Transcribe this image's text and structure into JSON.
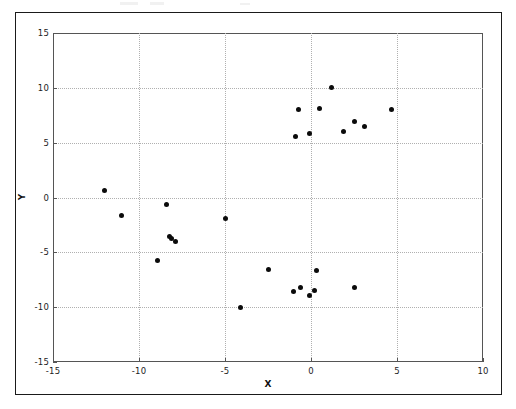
{
  "figure": {
    "background_color": "#ffffff",
    "frame_color": "#1a1a1a",
    "axes_color": "#555555",
    "grid_color": "#b0b0b0",
    "marker_color": "#0b0b0b"
  },
  "chart_data": {
    "type": "scatter",
    "title": "",
    "xlabel": "X",
    "ylabel": "Y",
    "xlim": [
      -15,
      10
    ],
    "ylim": [
      -15,
      15
    ],
    "xticks": [
      -15,
      -10,
      -5,
      0,
      5,
      10
    ],
    "yticks": [
      -15,
      -10,
      -5,
      0,
      5,
      10,
      15
    ],
    "xticklabels": [
      "-15",
      "-10",
      "-5",
      "0",
      "5",
      "10"
    ],
    "yticklabels": [
      "-15",
      "-10",
      "-5",
      "0",
      "5",
      "10",
      "15"
    ],
    "grid": true,
    "grid_style": "dotted",
    "legend": false,
    "marker": "circle",
    "marker_size": 5,
    "series": [
      {
        "name": "points",
        "color": "#0b0b0b",
        "points": [
          [
            -12.0,
            0.6
          ],
          [
            -11.0,
            -1.6
          ],
          [
            -8.4,
            -0.6
          ],
          [
            -8.2,
            -3.6
          ],
          [
            -8.1,
            -3.7
          ],
          [
            -7.9,
            -4.0
          ],
          [
            -8.9,
            -5.7
          ],
          [
            -5.0,
            -1.9
          ],
          [
            -4.1,
            -10.0
          ],
          [
            -2.5,
            -6.6
          ],
          [
            -1.0,
            -8.6
          ],
          [
            -0.6,
            -8.2
          ],
          [
            -0.1,
            -8.9
          ],
          [
            0.2,
            -8.5
          ],
          [
            0.3,
            -6.7
          ],
          [
            2.5,
            -8.2
          ],
          [
            -0.9,
            5.6
          ],
          [
            -0.7,
            8.0
          ],
          [
            -0.1,
            5.8
          ],
          [
            0.5,
            8.1
          ],
          [
            1.2,
            10.0
          ],
          [
            1.9,
            6.0
          ],
          [
            2.5,
            6.9
          ],
          [
            3.1,
            6.5
          ],
          [
            4.7,
            8.0
          ]
        ]
      }
    ]
  }
}
